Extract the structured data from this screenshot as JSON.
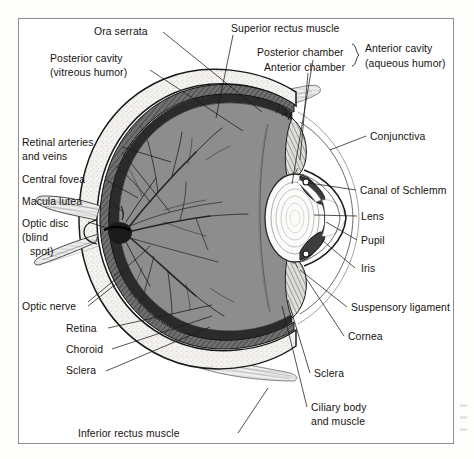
{
  "figure": {
    "frame_color": "#8e8e8e",
    "background": "#ffffff",
    "vitreous_fill": "#8d8d8d",
    "sclera_fill": "#f2f0ec",
    "ink": "#15130f"
  },
  "labels": {
    "ora_serrata": "Ora serrata",
    "posterior_cavity_l1": "Posterior cavity",
    "posterior_cavity_l2": "(vitreous humor)",
    "retinal_arteries_l1": "Retinal arteries",
    "retinal_arteries_l2": "and veins",
    "central_fovea": "Central fovea",
    "macula_lutea": "Macula lutea",
    "optic_disc_l1": "Optic disc",
    "optic_disc_l2": "(blind",
    "optic_disc_l3": "spot)",
    "optic_nerve": "Optic nerve",
    "retina": "Retina",
    "choroid": "Choroid",
    "sclera_left": "Sclera",
    "inferior_rectus": "Inferior rectus muscle",
    "superior_rectus": "Superior rectus muscle",
    "posterior_chamber": "Posterior chamber",
    "anterior_chamber": "Anterior chamber",
    "anterior_cavity_l1": "Anterior cavity",
    "anterior_cavity_l2": "(aqueous humor)",
    "conjunctiva": "Conjunctiva",
    "canal_of_schlemm": "Canal of Schlemm",
    "lens": "Lens",
    "pupil": "Pupil",
    "iris": "Iris",
    "suspensory_ligament": "Suspensory ligament",
    "cornea": "Cornea",
    "sclera_right": "Sclera",
    "ciliary_body_l1": "Ciliary body",
    "ciliary_body_l2": "and muscle"
  },
  "structures": [
    "sclera",
    "choroid",
    "retina",
    "vitreous-body",
    "optic-nerve",
    "optic-disc",
    "central-fovea",
    "retinal-vessels",
    "ora-serrata",
    "ciliary-body",
    "suspensory-ligament",
    "lens",
    "iris",
    "pupil",
    "cornea",
    "anterior-chamber",
    "posterior-chamber",
    "conjunctiva",
    "canal-of-schlemm",
    "superior-rectus-muscle",
    "inferior-rectus-muscle"
  ]
}
